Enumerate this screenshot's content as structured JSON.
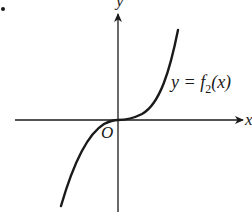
{
  "diagram": {
    "type": "function-graph",
    "bullet": "•",
    "axes": {
      "x_label": "x",
      "y_label": "y",
      "origin_label": "O"
    },
    "curve": {
      "label_prefix": "y = f",
      "label_subscript": "2",
      "label_suffix": "(x)",
      "shape": "cubic-like, increasing, inflection at origin"
    },
    "colors": {
      "ink": "#1a1a1a",
      "background": "#ffffff"
    }
  }
}
